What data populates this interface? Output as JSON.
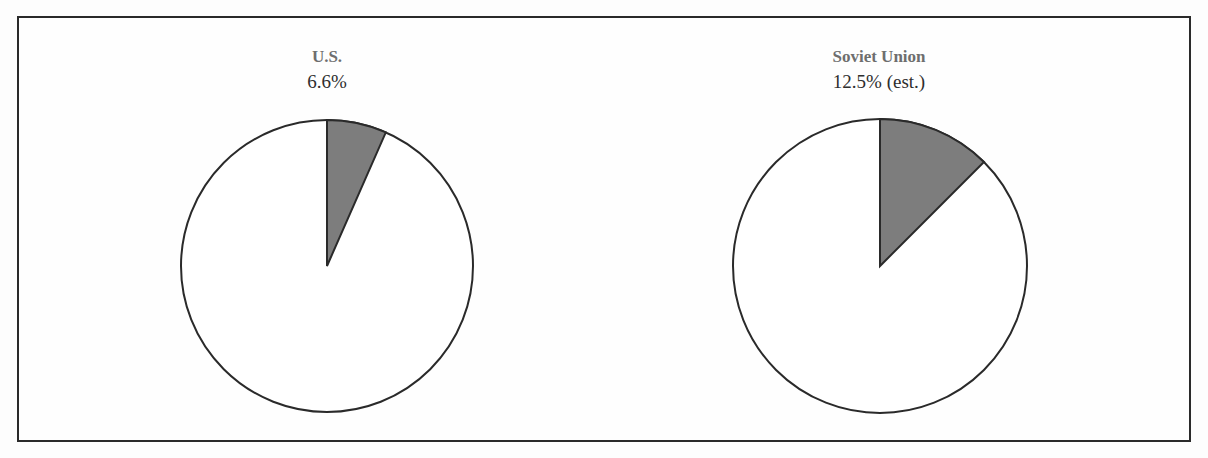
{
  "chart_data": {
    "type": "pie",
    "title": "",
    "pies": [
      {
        "name": "U.S.",
        "label": "6.6%",
        "slices": [
          {
            "label": "share",
            "value": 6.6,
            "color": "#7d7d7d"
          },
          {
            "label": "remainder",
            "value": 93.4,
            "color": "#ffffff"
          }
        ]
      },
      {
        "name": "Soviet Union",
        "label": "12.5% (est.)",
        "slices": [
          {
            "label": "share",
            "value": 12.5,
            "color": "#7d7d7d"
          },
          {
            "label": "remainder",
            "value": 87.5,
            "color": "#ffffff"
          }
        ]
      }
    ],
    "legend": "none"
  },
  "pies": [
    {
      "name": "U.S.",
      "value_label": "6.6%",
      "percent": 6.6
    },
    {
      "name": "Soviet Union",
      "value_label": "12.5% (est.)",
      "percent": 12.5
    }
  ],
  "colors": {
    "slice_fill": "#7d7d7d",
    "remainder_fill": "#ffffff",
    "outline": "#2a2a2a",
    "name_text": "#6e6e6e",
    "value_text": "#2e2e2e"
  }
}
